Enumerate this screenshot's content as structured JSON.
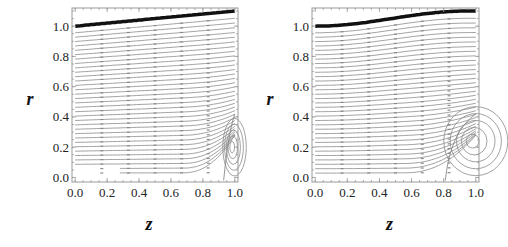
{
  "chart_data": [
    {
      "type": "streamline",
      "panel": "left",
      "title": "",
      "xlabel": "z",
      "ylabel": "r",
      "xlim": [
        -0.02,
        1.02
      ],
      "ylim": [
        -0.03,
        1.12
      ],
      "xticks": [
        "0.0",
        "0.2",
        "0.4",
        "0.6",
        "0.8",
        "1.0"
      ],
      "yticks": [
        "0.0",
        "0.2",
        "0.4",
        "0.6",
        "0.8",
        "1.0"
      ],
      "boundary": {
        "description": "thick upper wall, linear rise",
        "z": [
          0.0,
          1.0
        ],
        "r": [
          1.0,
          1.1
        ]
      },
      "recirculation": {
        "center_z": 0.98,
        "center_r": 0.2,
        "separation_z": 0.93
      },
      "grid": false
    },
    {
      "type": "streamline",
      "panel": "right",
      "title": "",
      "xlabel": "z",
      "ylabel": "r",
      "xlim": [
        -0.02,
        1.02
      ],
      "ylim": [
        -0.03,
        1.12
      ],
      "xticks": [
        "0.0",
        "0.2",
        "0.4",
        "0.6",
        "0.8",
        "1.0"
      ],
      "yticks": [
        "0.0",
        "0.2",
        "0.4",
        "0.6",
        "0.8",
        "1.0"
      ],
      "boundary": {
        "description": "thick upper wall, sigmoidal rise",
        "z": [
          0.0,
          0.5,
          1.0
        ],
        "r": [
          1.0,
          1.05,
          1.1
        ]
      },
      "recirculation": {
        "center_z": 0.97,
        "center_r": 0.24,
        "separation_z": 0.81
      },
      "grid": false
    }
  ],
  "colors": {
    "wall": "#111111",
    "streamline": "#8a8a8a",
    "frame": "#9a9a9a",
    "text": "#222222"
  }
}
